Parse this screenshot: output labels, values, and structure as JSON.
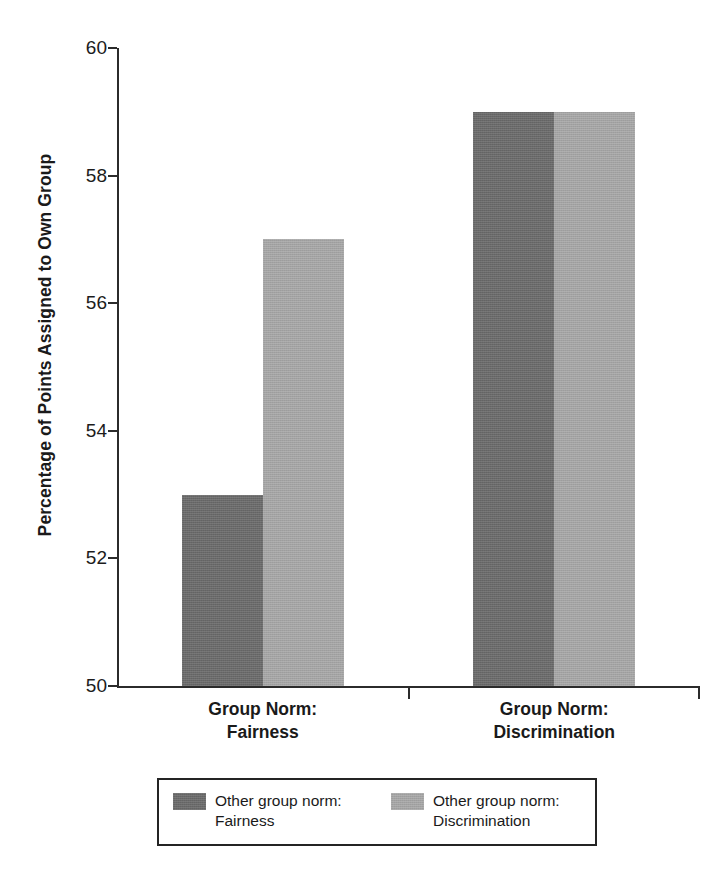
{
  "chart_data": {
    "type": "bar",
    "title": "",
    "subtitle": "",
    "xlabel": "",
    "ylabel": "Percentage of Points Assigned to Own Group",
    "ylim": [
      50,
      60
    ],
    "ytick_values": [
      50,
      52,
      54,
      56,
      58,
      60
    ],
    "ytick_labels": [
      "50",
      "52",
      "54",
      "56",
      "58",
      "60"
    ],
    "grid": false,
    "legend_position": "bottom",
    "categories": [
      {
        "line1": "Group Norm:",
        "line2": "Fairness"
      },
      {
        "line1": "Group Norm:",
        "line2": "Discrimination"
      }
    ],
    "category_labels": [
      "Group Norm: Fairness",
      "Group Norm: Discrimination"
    ],
    "series": [
      {
        "name": "Other group norm: Fairness",
        "legend_line1": "Other group norm:",
        "legend_line2": "Fairness",
        "color": "#6d6d6d",
        "values": [
          53,
          59
        ]
      },
      {
        "name": "Other group norm: Discrimination",
        "legend_line1": "Other group norm:",
        "legend_line2": "Discrimination",
        "color": "#aaaaaa",
        "values": [
          57,
          59
        ]
      }
    ],
    "annotations": [],
    "axis_color": "#2b2b2b",
    "background_color": "#ffffff"
  }
}
